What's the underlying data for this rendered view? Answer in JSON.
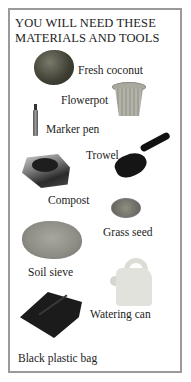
{
  "title": "YOU WILL NEED THESE MATERIALS AND TOOLS",
  "items": [
    {
      "label": "Fresh coconut",
      "icon": "coconut-icon"
    },
    {
      "label": "Flowerpot",
      "icon": "flowerpot-icon"
    },
    {
      "label": "Marker pen",
      "icon": "marker-pen-icon"
    },
    {
      "label": "Trowel",
      "icon": "trowel-icon"
    },
    {
      "label": "Compost",
      "icon": "compost-icon"
    },
    {
      "label": "Grass seed",
      "icon": "grass-seed-icon"
    },
    {
      "label": "Soil sieve",
      "icon": "soil-sieve-icon"
    },
    {
      "label": "Watering can",
      "icon": "watering-can-icon"
    },
    {
      "label": "Black plastic bag",
      "icon": "black-plastic-bag-icon"
    }
  ],
  "colors": {
    "frame": "#9a9a9a",
    "text": "#222222",
    "background": "#ffffff"
  }
}
